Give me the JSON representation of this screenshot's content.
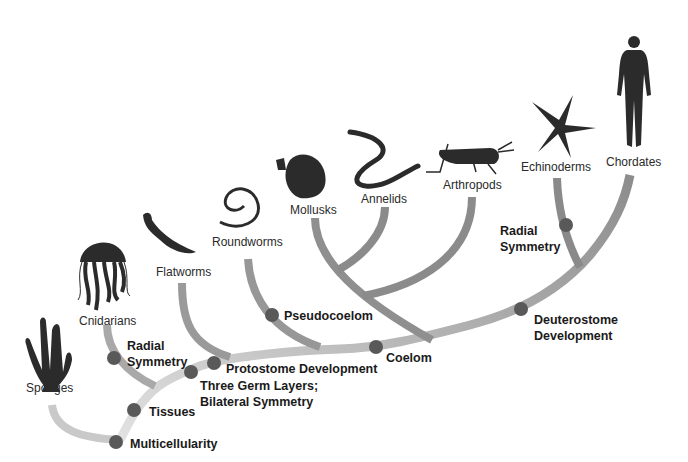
{
  "diagram": {
    "type": "phylogenetic-tree",
    "colors": {
      "branch": "#8a8a8a",
      "branch_light": "#c8c8c8",
      "node": "#5a5a5a",
      "silhouette": "#2b2b2b"
    },
    "taxa": [
      {
        "id": "sponges",
        "label": "Sponges",
        "icon": "sponge-icon"
      },
      {
        "id": "cnidarians",
        "label": "Cnidarians",
        "icon": "jellyfish-icon"
      },
      {
        "id": "flatworms",
        "label": "Flatworms",
        "icon": "flatworm-icon"
      },
      {
        "id": "roundworms",
        "label": "Roundworms",
        "icon": "roundworm-icon"
      },
      {
        "id": "mollusks",
        "label": "Mollusks",
        "icon": "shell-icon"
      },
      {
        "id": "annelids",
        "label": "Annelids",
        "icon": "segmented-worm-icon"
      },
      {
        "id": "arthropods",
        "label": "Arthropods",
        "icon": "grasshopper-icon"
      },
      {
        "id": "echinoderms",
        "label": "Echinoderms",
        "icon": "starfish-icon"
      },
      {
        "id": "chordates",
        "label": "Chordates",
        "icon": "human-icon"
      }
    ],
    "traits": [
      {
        "id": "multicellularity",
        "label": "Multicellularity"
      },
      {
        "id": "tissues",
        "label": "Tissues"
      },
      {
        "id": "radial_symmetry_cnidarians",
        "label_line1": "Radial",
        "label_line2": "Symmetry"
      },
      {
        "id": "three_germ_layers",
        "label_line1": "Three Germ Layers;",
        "label_line2": "Bilateral Symmetry"
      },
      {
        "id": "protostome",
        "label": "Protostome Development"
      },
      {
        "id": "pseudocoelom",
        "label": "Pseudocoelom"
      },
      {
        "id": "coelom",
        "label": "Coelom"
      },
      {
        "id": "deuterostome",
        "label_line1": "Deuterostome",
        "label_line2": "Development"
      },
      {
        "id": "radial_symmetry_echinoderms",
        "label_line1": "Radial",
        "label_line2": "Symmetry"
      }
    ]
  }
}
